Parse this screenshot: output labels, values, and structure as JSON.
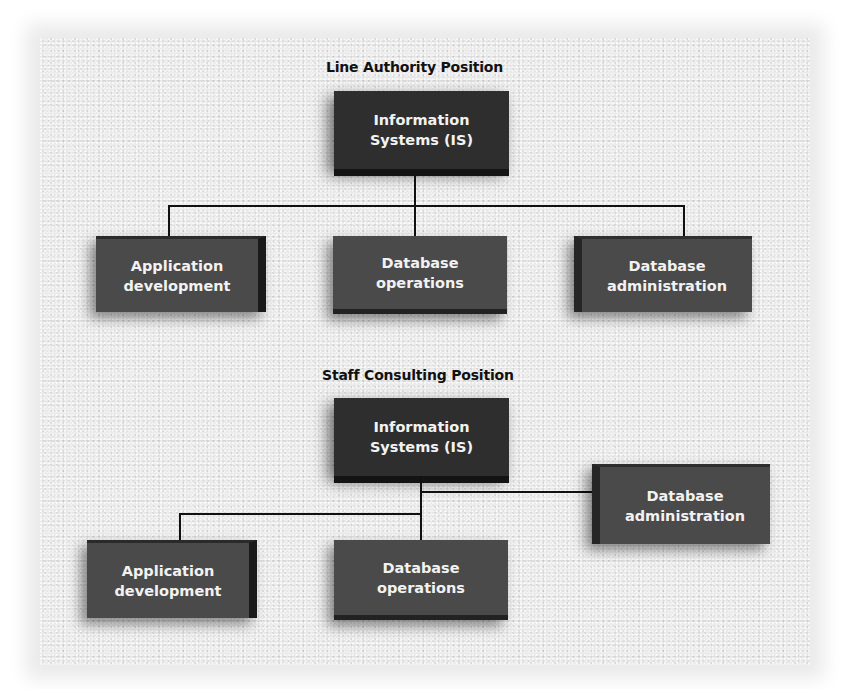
{
  "diagram": {
    "line_authority": {
      "title": "Line Authority Position",
      "root": {
        "line1": "Information",
        "line2": "Systems (IS)"
      },
      "children": [
        {
          "line1": "Application",
          "line2": "development"
        },
        {
          "line1": "Database",
          "line2": "operations"
        },
        {
          "line1": "Database",
          "line2": "administration"
        }
      ]
    },
    "staff_consulting": {
      "title": "Staff Consulting Position",
      "root": {
        "line1": "Information",
        "line2": "Systems (IS)"
      },
      "staff": {
        "line1": "Database",
        "line2": "administration"
      },
      "children": [
        {
          "line1": "Application",
          "line2": "development"
        },
        {
          "line1": "Database",
          "line2": "operations"
        }
      ]
    }
  }
}
